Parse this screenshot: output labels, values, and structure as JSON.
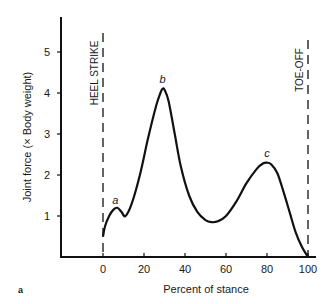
{
  "figure": {
    "panel_label": "a"
  },
  "chart_data": {
    "type": "line",
    "title": "",
    "xlabel": "Percent of stance",
    "ylabel": "Joint force (× Body weight)",
    "xlim": [
      -20,
      102
    ],
    "ylim": [
      0,
      5.9
    ],
    "xticks": [
      0,
      20,
      40,
      60,
      80,
      100
    ],
    "yticks": [
      1,
      2,
      3,
      4,
      5
    ],
    "grid": false,
    "legend": null,
    "series": [
      {
        "name": "Joint force",
        "x": [
          0,
          1,
          3,
          5,
          7,
          9,
          11,
          14,
          18,
          22,
          26,
          28,
          29,
          30,
          32,
          35,
          38,
          42,
          46,
          50,
          53,
          56,
          60,
          65,
          70,
          75,
          78,
          80,
          82,
          85,
          88,
          91,
          94,
          97,
          100
        ],
        "y": [
          0.5,
          0.75,
          1.0,
          1.15,
          1.2,
          1.1,
          1.0,
          1.3,
          2.0,
          2.9,
          3.7,
          4.0,
          4.1,
          4.08,
          3.8,
          3.0,
          2.2,
          1.5,
          1.1,
          0.9,
          0.85,
          0.87,
          1.0,
          1.35,
          1.8,
          2.15,
          2.28,
          2.3,
          2.26,
          2.05,
          1.6,
          1.1,
          0.6,
          0.25,
          0.0
        ]
      }
    ],
    "annotations": [
      {
        "text": "a",
        "x": 6,
        "y": 1.3
      },
      {
        "text": "b",
        "x": 29,
        "y": 4.25
      },
      {
        "text": "c",
        "x": 80,
        "y": 2.45
      }
    ],
    "vertical_markers": [
      {
        "label": "HEEL STRIKE",
        "x": 0,
        "style": "dashed"
      },
      {
        "label": "TOE-OFF",
        "x": 100,
        "style": "dashed"
      }
    ]
  }
}
